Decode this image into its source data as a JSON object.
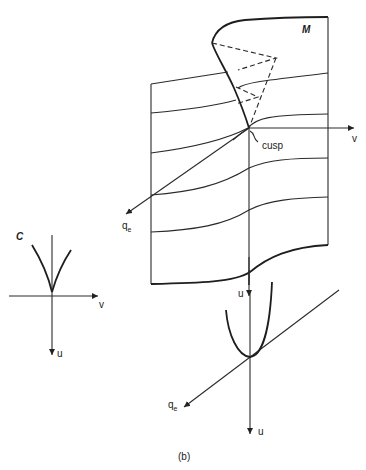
{
  "figure": {
    "caption": "(b)",
    "main_surface": {
      "label": "M",
      "axis_v": "v",
      "axis_u": "u",
      "axis_q": "q",
      "axis_q_sub": "e",
      "annotation": "cusp"
    },
    "projection_c": {
      "label": "C",
      "axis_v": "v",
      "axis_u": "u"
    },
    "section_plot": {
      "axis_q": "q",
      "axis_q_sub": "e",
      "axis_u": "u"
    }
  }
}
